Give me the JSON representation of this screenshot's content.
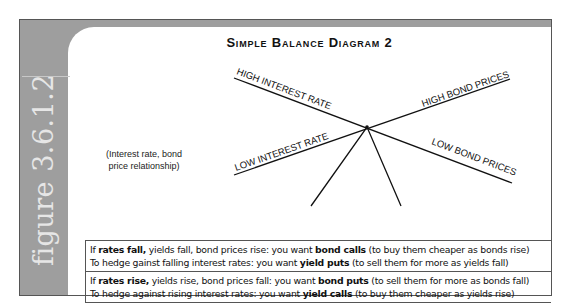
{
  "figure_label": "figure 3.6.1.2",
  "title": "Simple Balance Diagram 2",
  "diagram": {
    "labels": {
      "high_interest_rate": "HIGH INTEREST RATE",
      "low_interest_rate": "LOW INTEREST RATE",
      "high_bond_prices": "HIGH BOND PRICES",
      "low_bond_prices": "LOW BOND PRICES"
    },
    "note_line1": "(Interest rate, bond",
    "note_line2": "price relationship)"
  },
  "rules": [
    {
      "line1": {
        "pre": "If ",
        "bold1": "rates fall,",
        "mid": " yields fall, bond prices rise: you want ",
        "bold2": "bond calls",
        "post": " (to buy them cheaper as bonds rise)"
      },
      "line2": {
        "pre": "To hedge gainst falling interest rates: you want ",
        "bold": "yield puts",
        "post": " (to sell them for more as yields fall)"
      }
    },
    {
      "line1": {
        "pre": "If ",
        "bold1": "rates rise,",
        "mid": " yields rise, bond prices fall: you want ",
        "bold2": "bond puts",
        "post": " (to sell them for more as bonds fall)"
      },
      "line2": {
        "pre": "To hedge against rising interest rates: you want ",
        "bold": "yield calls",
        "post": " (to buy them cheaper as yields rise)"
      }
    }
  ],
  "colors": {
    "frame_gray": "#9e9e9e",
    "label_text": "#e6e6e6",
    "ink": "#111111"
  }
}
